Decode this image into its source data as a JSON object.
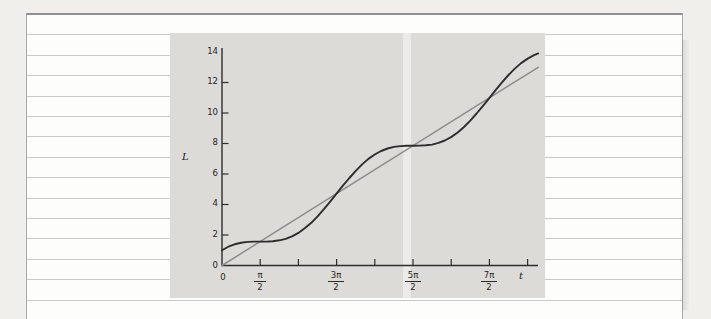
{
  "page": {
    "bg_outer": "#f0efec",
    "bg_page": "#fdfdfc",
    "rule_color": "#c9c9c9",
    "frame_color": "#8f8f8f"
  },
  "chart": {
    "panel_bg": "#dcdbd8",
    "ylabel": "L",
    "xlabel": "t",
    "origin_label_x": "0",
    "y_tick_labels": [
      "0",
      "2",
      "4",
      "6",
      "8",
      "10",
      "12",
      "14"
    ],
    "x_fracs": [
      {
        "num": "π",
        "den": "2"
      },
      {
        "num": "3π",
        "den": "2"
      },
      {
        "num": "5π",
        "den": "2"
      },
      {
        "num": "7π",
        "den": "2"
      }
    ]
  },
  "chart_data": {
    "type": "line",
    "title": "",
    "xlabel": "t",
    "ylabel": "L",
    "xlim": [
      0,
      13.0
    ],
    "ylim": [
      0,
      14.3
    ],
    "grid": false,
    "legend": null,
    "axis_color": "#2e2e2e",
    "x_ticks_rad": [
      1.5708,
      3.1416,
      4.7124,
      6.2832,
      7.854,
      9.4248,
      10.9956,
      12.5664
    ],
    "x_tick_labels": [
      "π/2",
      "",
      "3π/2",
      "",
      "5π/2",
      "",
      "7π/2",
      ""
    ],
    "y_ticks": [
      2,
      4,
      6,
      8,
      10,
      12
    ],
    "y_tick_labels": [
      "2",
      "4",
      "6",
      "8",
      "10",
      "12"
    ],
    "series": [
      {
        "name": "L = t",
        "color": "#8d8d8d",
        "width": 1.5,
        "points": [
          [
            0,
            0
          ],
          [
            13.0,
            13.0
          ]
        ]
      },
      {
        "name": "L = t + cos t",
        "color": "#2d2d2d",
        "width": 1.9,
        "points": [
          [
            0,
            1
          ],
          [
            0.26,
            1.23
          ],
          [
            0.52,
            1.39
          ],
          [
            0.79,
            1.49
          ],
          [
            1.05,
            1.55
          ],
          [
            1.31,
            1.57
          ],
          [
            1.57,
            1.57
          ],
          [
            1.83,
            1.57
          ],
          [
            2.09,
            1.59
          ],
          [
            2.36,
            1.65
          ],
          [
            2.62,
            1.75
          ],
          [
            2.88,
            1.91
          ],
          [
            3.14,
            2.14
          ],
          [
            3.4,
            2.44
          ],
          [
            3.67,
            2.8
          ],
          [
            3.93,
            3.22
          ],
          [
            4.19,
            3.69
          ],
          [
            4.45,
            4.19
          ],
          [
            4.71,
            4.71
          ],
          [
            4.97,
            5.23
          ],
          [
            5.24,
            5.74
          ],
          [
            5.5,
            6.2
          ],
          [
            5.76,
            6.63
          ],
          [
            6.02,
            6.99
          ],
          [
            6.28,
            7.28
          ],
          [
            6.54,
            7.51
          ],
          [
            6.81,
            7.67
          ],
          [
            7.07,
            7.78
          ],
          [
            7.33,
            7.83
          ],
          [
            7.59,
            7.85
          ],
          [
            7.85,
            7.85
          ],
          [
            8.12,
            7.86
          ],
          [
            8.38,
            7.88
          ],
          [
            8.64,
            7.93
          ],
          [
            8.9,
            8.04
          ],
          [
            9.16,
            8.2
          ],
          [
            9.42,
            8.42
          ],
          [
            9.69,
            8.72
          ],
          [
            9.95,
            9.08
          ],
          [
            10.21,
            9.5
          ],
          [
            10.47,
            9.97
          ],
          [
            10.73,
            10.47
          ],
          [
            11.0,
            11.0
          ],
          [
            11.26,
            11.52
          ],
          [
            11.52,
            12.02
          ],
          [
            11.78,
            12.49
          ],
          [
            12.04,
            12.91
          ],
          [
            12.3,
            13.27
          ],
          [
            12.57,
            13.57
          ],
          [
            12.83,
            13.79
          ],
          [
            13.0,
            13.91
          ]
        ]
      }
    ],
    "axes_px": {
      "origin": [
        52,
        232.5
      ],
      "x_per_unit": 24.32,
      "y_per_unit": 15.25,
      "x_axis_end": 368,
      "y_axis_top": 15,
      "tick_len": 6.5
    }
  }
}
